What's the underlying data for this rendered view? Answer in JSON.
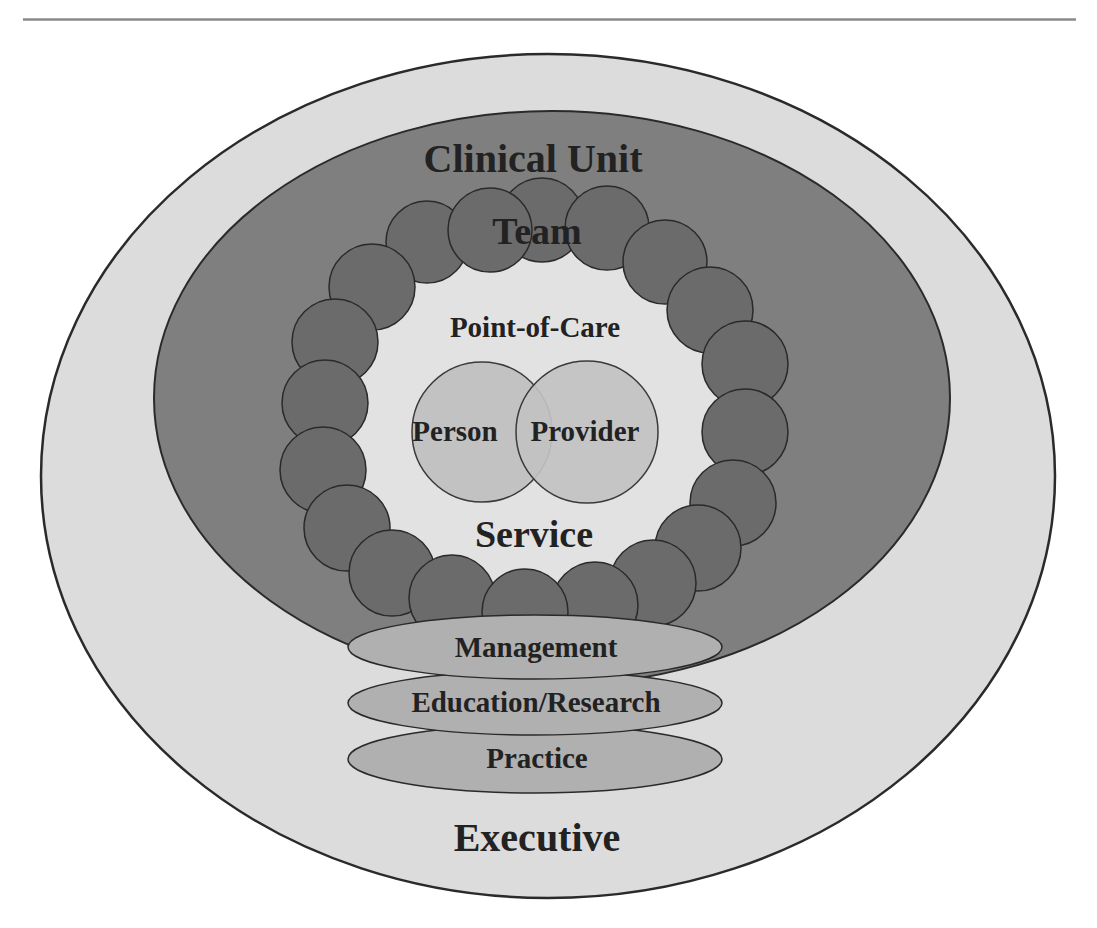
{
  "diagram": {
    "type": "nested-layers",
    "colors": {
      "background": "#ffffff",
      "rule": "#8a8a8a",
      "outer_fill": "#dcdcdc",
      "clinical_unit_fill": "#7f7f7f",
      "team_circle_fill": "#6b6b6b",
      "point_of_care_fill": "#e2e2e2",
      "person_provider_fill": "#c2c2c2",
      "layer_ellipse_fill": "#b0b0b0",
      "stroke": "#2a2a2a",
      "text": "#222222"
    },
    "layers": {
      "executive": {
        "label": "Executive"
      },
      "clinical_unit": {
        "label": "Clinical Unit"
      },
      "team": {
        "label": "Team"
      },
      "point_of_care": {
        "label": "Point-of-Care"
      },
      "service": {
        "label": "Service"
      },
      "person": {
        "label": "Person"
      },
      "provider": {
        "label": "Provider"
      }
    },
    "support_layers": [
      {
        "label": "Management"
      },
      {
        "label": "Education/Research"
      },
      {
        "label": "Practice"
      }
    ],
    "team_circle_count": 24
  }
}
